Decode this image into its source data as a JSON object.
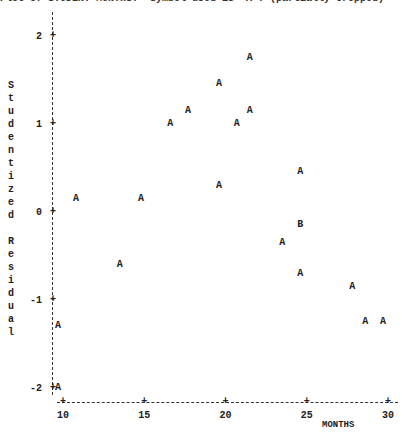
{
  "title": "Plot of STUDENT*MONTHS.  Symbol used is 'A'. (partially cropped)",
  "chart_data": {
    "type": "scatter",
    "xlabel": "MONTHS",
    "ylabel": "Studentized Residual",
    "xlim": [
      10,
      30
    ],
    "ylim": [
      -2,
      2
    ],
    "x_ticks": [
      "10",
      "15",
      "20",
      "25",
      "30"
    ],
    "y_ticks": [
      "2",
      "1",
      "0",
      "-1",
      "-2"
    ],
    "legend": "A = 1 obs, B = 2 obs",
    "grid": false,
    "points": [
      {
        "x": 9.7,
        "y": -1.3,
        "symbol": "A"
      },
      {
        "x": 9.7,
        "y": -2.0,
        "symbol": "A"
      },
      {
        "x": 10.8,
        "y": 0.15,
        "symbol": "A"
      },
      {
        "x": 13.5,
        "y": -0.6,
        "symbol": "A"
      },
      {
        "x": 14.8,
        "y": 0.15,
        "symbol": "A"
      },
      {
        "x": 16.6,
        "y": 1.0,
        "symbol": "A"
      },
      {
        "x": 17.7,
        "y": 1.15,
        "symbol": "A"
      },
      {
        "x": 19.6,
        "y": 1.45,
        "symbol": "A"
      },
      {
        "x": 19.6,
        "y": 0.3,
        "symbol": "A"
      },
      {
        "x": 20.7,
        "y": 1.0,
        "symbol": "A"
      },
      {
        "x": 21.5,
        "y": 1.75,
        "symbol": "A"
      },
      {
        "x": 21.5,
        "y": 1.15,
        "symbol": "A"
      },
      {
        "x": 23.5,
        "y": -0.35,
        "symbol": "A"
      },
      {
        "x": 24.6,
        "y": 0.45,
        "symbol": "A"
      },
      {
        "x": 24.6,
        "y": -0.15,
        "symbol": "B"
      },
      {
        "x": 24.6,
        "y": -0.7,
        "symbol": "A"
      },
      {
        "x": 27.8,
        "y": -0.85,
        "symbol": "A"
      },
      {
        "x": 28.6,
        "y": -1.25,
        "symbol": "A"
      },
      {
        "x": 29.7,
        "y": -1.25,
        "symbol": "A"
      }
    ]
  },
  "ylabel_chars": [
    "S",
    "t",
    "u",
    "d",
    "e",
    "n",
    "t",
    "i",
    "z",
    "e",
    "d",
    " ",
    "R",
    "e",
    "s",
    "i",
    "d",
    "u",
    "a",
    "l"
  ],
  "xaxis_label": "MONTHS"
}
